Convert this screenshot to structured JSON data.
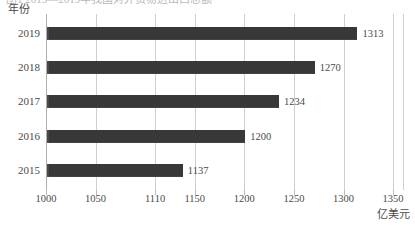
{
  "caption": {
    "text": "图1  2015—2019年我国对外贸易进出口总额"
  },
  "chart_data": {
    "type": "bar",
    "orientation": "horizontal",
    "title": "",
    "subtitle": "",
    "xlabel": "亿美元",
    "ylabel": "年份",
    "categories": [
      "2019",
      "2018",
      "2017",
      "2016",
      "2015"
    ],
    "values": [
      1313,
      1270,
      1234,
      1200,
      1137
    ],
    "value_labels": [
      "1313",
      "1270",
      "1234",
      "1200",
      "1137"
    ],
    "xlim": [
      1000,
      1360
    ],
    "xticks": [
      1000,
      1050,
      1110,
      1150,
      1200,
      1250,
      1300,
      1350
    ],
    "xtick_labels": [
      "1000",
      "1050",
      "1110",
      "1150",
      "1200",
      "1250",
      "1300",
      "1350"
    ],
    "grid": true,
    "grid_axis": "x",
    "legend": "none",
    "bar_color": "#3d3d3d",
    "grid_color": "#cfcfcf",
    "text_color": "#4a4a4a"
  }
}
